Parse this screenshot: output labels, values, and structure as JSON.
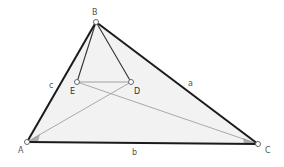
{
  "diagram": {
    "points": {
      "A": {
        "label": "A",
        "x": 27,
        "y": 142,
        "lx": 18,
        "ly": 153
      },
      "B": {
        "label": "B",
        "x": 96,
        "y": 22,
        "lx": 92,
        "ly": 15
      },
      "C": {
        "label": "C",
        "x": 258,
        "y": 144,
        "lx": 265,
        "ly": 153
      },
      "D": {
        "label": "D",
        "x": 131,
        "y": 82,
        "lx": 134,
        "ly": 94
      },
      "E": {
        "label": "E",
        "x": 77,
        "y": 82,
        "lx": 70,
        "ly": 94
      }
    },
    "side_labels": {
      "a": {
        "label": "a",
        "x": 188,
        "y": 86
      },
      "b": {
        "label": "b",
        "x": 132,
        "y": 155
      },
      "c": {
        "label": "c",
        "x": 49,
        "y": 88
      }
    },
    "colors": {
      "triangle_fill": "#f2f2f2",
      "triangle_edge": "#1a1a1a",
      "inner_line": "#555555",
      "cevian_line": "#999999",
      "point_stroke": "#666666",
      "angle_mark": "#888888"
    }
  }
}
